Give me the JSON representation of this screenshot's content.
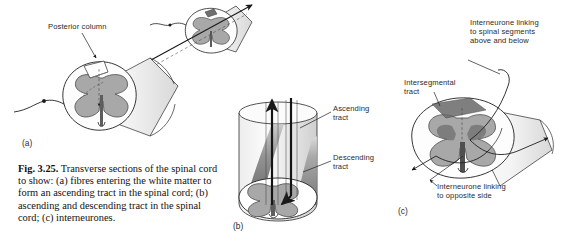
{
  "figure": {
    "number": "Fig. 3.25.",
    "caption_text": " Transverse sections of the spinal cord to show: (a) fibres entering the white matter to form an ascending tract in the spinal cord; (b) ascending and descending tract in the spinal cord; (c) interneurones."
  },
  "panels": {
    "a": {
      "tag": "(a)"
    },
    "b": {
      "tag": "(b)"
    },
    "c": {
      "tag": "(c)"
    }
  },
  "labels": {
    "posterior_column": "Posterior column",
    "ascending_tract": "Ascending\ntract",
    "descending_tract": "Descending\ntract",
    "interneurone_above_below": "Interneurone linking\nto spinal segments\nabove and below",
    "intersegmental_tract": "Intersegmental\ntract",
    "interneurone_opposite": "Interneurone linking\nto opposite side"
  },
  "colors": {
    "background": "#ffffff",
    "ink": "#1a1a1a",
    "gray_matter": "#a8a8a8",
    "gray_matter_dark": "#6f6f6f",
    "tract_shade": "#888888",
    "tract_dark": "#4a4a4a",
    "outline": "#222222"
  }
}
